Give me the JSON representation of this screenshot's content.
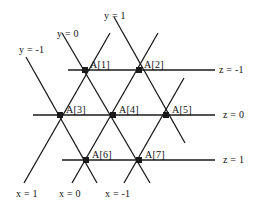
{
  "figure": {
    "type": "diagram",
    "background_color": "#ffffff",
    "line_color": "#1a1a1a",
    "text_color": "#111111",
    "width": 270,
    "height": 215
  },
  "nodes": [
    {
      "id": "A1",
      "label": "A[1]",
      "x": 85,
      "y": 70,
      "label_x": 90,
      "label_y": 59
    },
    {
      "id": "A2",
      "label": "A[2]",
      "x": 139,
      "y": 70,
      "label_x": 144,
      "label_y": 59
    },
    {
      "id": "A3",
      "label": "A[3]",
      "x": 60,
      "y": 115,
      "label_x": 66,
      "label_y": 104
    },
    {
      "id": "A4",
      "label": "A[4]",
      "x": 113,
      "y": 115,
      "label_x": 119,
      "label_y": 104
    },
    {
      "id": "A5",
      "label": "A[5]",
      "x": 166,
      "y": 115,
      "label_x": 172,
      "label_y": 104
    },
    {
      "id": "A6",
      "label": "A[6]",
      "x": 86,
      "y": 160,
      "label_x": 92,
      "label_y": 149
    },
    {
      "id": "A7",
      "label": "A[7]",
      "x": 139,
      "y": 160,
      "label_x": 145,
      "label_y": 149
    }
  ],
  "horizontal_lines": [
    {
      "id": "z-minus-1",
      "label": "z = -1",
      "y": 70,
      "x_start": 68,
      "x_end": 215,
      "label_x": 219,
      "label_y": 64
    },
    {
      "id": "z-0",
      "label": "z = 0",
      "y": 115,
      "x_start": 33,
      "x_end": 215,
      "label_x": 223,
      "label_y": 109
    },
    {
      "id": "z-1",
      "label": "z = 1",
      "y": 160,
      "x_start": 62,
      "x_end": 215,
      "label_x": 223,
      "label_y": 154
    }
  ],
  "diagonals_down_right": [
    {
      "id": "y-minus-1",
      "label": "y = -1",
      "x1": 26,
      "y1": 57,
      "x2": 97,
      "y2": 183,
      "label_x": 19,
      "label_y": 44
    },
    {
      "id": "y-0",
      "label": "y = 0",
      "x1": 62,
      "y1": 33,
      "x2": 150,
      "y2": 183,
      "label_x": 57,
      "label_y": 28
    },
    {
      "id": "y-1",
      "label": "y = 1",
      "x1": 114,
      "y1": 17,
      "x2": 185,
      "y2": 143,
      "label_x": 104,
      "label_y": 10
    }
  ],
  "diagonals_up_right": [
    {
      "id": "x-1",
      "label": "x = 1",
      "x1": 24,
      "y1": 183,
      "x2": 110,
      "y2": 33,
      "label_x": 16,
      "label_y": 188
    },
    {
      "id": "x-0",
      "label": "x = 0",
      "x1": 72,
      "y1": 183,
      "x2": 158,
      "y2": 33,
      "label_x": 59,
      "label_y": 188
    },
    {
      "id": "x-minus-1",
      "label": "x = -1",
      "x1": 124,
      "y1": 183,
      "x2": 184,
      "y2": 78,
      "label_x": 105,
      "label_y": 188
    }
  ]
}
